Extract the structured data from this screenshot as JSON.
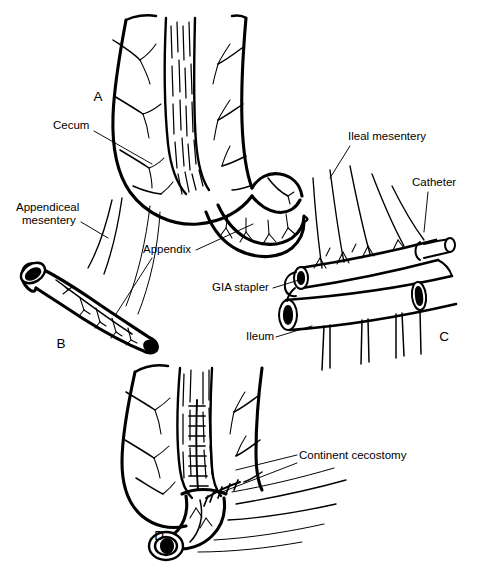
{
  "figure": {
    "background_color": "#ffffff",
    "ink_color": "#000000",
    "width": 500,
    "height": 583
  },
  "panels": [
    {
      "id": "A",
      "letter": "A",
      "caption": "Cecum with appendix and taenia coli in situ",
      "letter_x": 98,
      "letter_y": 101
    },
    {
      "id": "B",
      "letter": "B",
      "caption": "Mobilized appendix on its appendiceal mesentery",
      "letter_x": 61,
      "letter_y": 348
    },
    {
      "id": "C",
      "letter": "C",
      "caption": "Ileal segment tubularized over a catheter with GIA stapler",
      "letter_x": 444,
      "letter_y": 341
    },
    {
      "id": "D",
      "letter": "D",
      "caption": "Completed continent cecostomy with sutured taenia tunnel",
      "letter_x": 159,
      "letter_y": 540
    }
  ],
  "labels": [
    {
      "key": "cecum",
      "text": "Cecum",
      "x": 53,
      "y": 129,
      "anchor": "start",
      "panel": "A"
    },
    {
      "key": "appendiceal-mesentery-line1",
      "text": "Appendiceal",
      "x": 16,
      "y": 211,
      "anchor": "start",
      "panel": "B"
    },
    {
      "key": "appendiceal-mesentery-line2",
      "text": "mesentery",
      "x": 22,
      "y": 224,
      "anchor": "start",
      "panel": "B"
    },
    {
      "key": "appendix",
      "text": "Appendix",
      "x": 143,
      "y": 253,
      "anchor": "start",
      "panel": "A"
    },
    {
      "key": "ileal-mesentery",
      "text": "Ileal mesentery",
      "x": 348,
      "y": 140,
      "anchor": "start",
      "panel": "C"
    },
    {
      "key": "catheter",
      "text": "Catheter",
      "x": 412,
      "y": 186,
      "anchor": "start",
      "panel": "C"
    },
    {
      "key": "gia-stapler",
      "text": "GIA stapler",
      "x": 212,
      "y": 291,
      "anchor": "start",
      "panel": "C"
    },
    {
      "key": "ileum",
      "text": "Ileum",
      "x": 246,
      "y": 340,
      "anchor": "start",
      "panel": "C"
    },
    {
      "key": "continent-cecostomy",
      "text": "Continent cecostomy",
      "x": 299,
      "y": 459,
      "anchor": "start",
      "panel": "D"
    }
  ],
  "anatomy_terms": [
    "Cecum",
    "Appendix",
    "Appendiceal mesentery",
    "Ileum",
    "Ileal mesentery",
    "Taenia coli",
    "Catheter",
    "GIA stapler",
    "Continent cecostomy"
  ]
}
